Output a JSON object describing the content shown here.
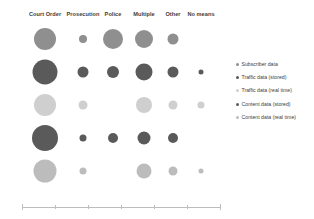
{
  "chart_data": {
    "type": "scatter",
    "title": "",
    "xlabel": "",
    "ylabel": "",
    "grid": false,
    "legend_position": "right",
    "categories": [
      "Court Order",
      "Prosecution",
      "Police",
      "Multiple",
      "Other",
      "No means"
    ],
    "rows": [
      "Subscriber data",
      "Traffic data (stored)",
      "Traffic data (real time)",
      "Content data (stored)",
      "Content data (real time)"
    ],
    "series": [
      {
        "name": "Subscriber data",
        "color": "#8f8f8f",
        "values": [
          11,
          4,
          10,
          9,
          5.5,
          0
        ]
      },
      {
        "name": "Traffic data (stored)",
        "color": "#5a5a5a",
        "values": [
          12.5,
          5.5,
          6,
          8.5,
          5.5,
          2.5
        ]
      },
      {
        "name": "Traffic data (real time)",
        "color": "#cfcfcf",
        "values": [
          11,
          4.5,
          0,
          8,
          4.5,
          3.5
        ]
      },
      {
        "name": "Content data (stored)",
        "color": "#5a5a5a",
        "values": [
          13,
          3.5,
          5,
          6.5,
          5,
          0
        ]
      },
      {
        "name": "Content data (real time)",
        "color": "#bcbcbc",
        "values": [
          11.5,
          3.5,
          0,
          7.5,
          4.5,
          2.5
        ]
      }
    ]
  },
  "header": {
    "labels": [
      "Court Order",
      "Prosecution",
      "Police",
      "Multiple",
      "Other",
      "No means"
    ]
  },
  "legend": {
    "items": [
      {
        "label": "Subscriber data",
        "color": "#8f8f8f"
      },
      {
        "label": "Traffic data (stored)",
        "color": "#5a5a5a"
      },
      {
        "label": "Traffic data (real time)",
        "color": "#cfcfcf"
      },
      {
        "label": "Content data (stored)",
        "color": "#5a5a5a"
      },
      {
        "label": "Content data (real time)",
        "color": "#bcbcbc"
      }
    ]
  },
  "axis": {
    "line_color": "#bdbdbd",
    "tick_count": 7
  },
  "layout": {
    "column_x": [
      45,
      83,
      113,
      144,
      173,
      201
    ],
    "row_y": [
      39,
      72,
      105,
      138,
      171
    ]
  }
}
